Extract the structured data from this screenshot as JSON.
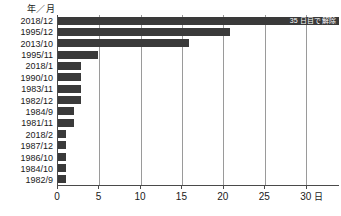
{
  "chart_data": {
    "type": "bar",
    "orientation": "horizontal",
    "title": "",
    "xlabel": "日",
    "ylabel": "年／月",
    "categories": [
      "2018/12",
      "1995/12",
      "2013/10",
      "1995/11",
      "2018/1",
      "1990/10",
      "1983/11",
      "1982/12",
      "1984/9",
      "1981/11",
      "2018/2",
      "1987/12",
      "1986/10",
      "1984/10",
      "1982/9"
    ],
    "values": [
      34.0,
      20.8,
      15.8,
      4.8,
      2.8,
      2.8,
      2.8,
      2.8,
      1.9,
      1.9,
      1.0,
      1.0,
      1.0,
      1.0,
      1.0
    ],
    "xlim": [
      0,
      34
    ],
    "xticks": [
      0,
      5,
      10,
      15,
      20,
      25,
      30
    ],
    "xtick_labels": [
      "0",
      "5",
      "10",
      "15",
      "20",
      "25",
      "30"
    ],
    "grid": true,
    "legend": false,
    "bar_color": "#3a3a3a",
    "annotations": [
      {
        "category": "2018/12",
        "text": "35 日目で解除",
        "position": "inside-right"
      }
    ]
  },
  "axis": {
    "y_header": "年／月",
    "x_unit": "日"
  }
}
